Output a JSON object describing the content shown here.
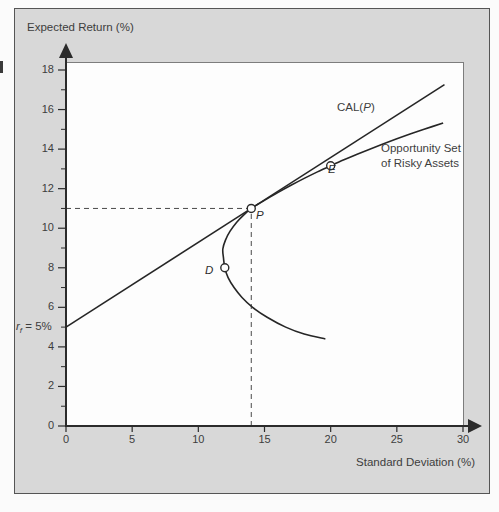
{
  "figure": {
    "y_axis_title": "Expected Return (%)",
    "x_axis_title": "Standard Deviation (%)",
    "rf_label": {
      "prefix": "r",
      "sub": "f",
      "suffix": " = 5%"
    },
    "cal_label": {
      "prefix": "CAL(",
      "p": "P",
      "suffix": ")"
    },
    "opportunity_label": {
      "line1": "Opportunity Set",
      "line2": "of Risky Assets"
    },
    "point_labels": {
      "p": "P",
      "d": "D",
      "e": "E"
    }
  },
  "colors": {
    "panel_background": "#d8d8d8",
    "line": "#262626",
    "dashed_guide": "#4a4a4a",
    "text": "#3d3d3d",
    "marker_fill": "#ffffff"
  },
  "chart_data": {
    "type": "line",
    "title": "",
    "xlabel": "Standard Deviation (%)",
    "ylabel": "Expected Return (%)",
    "xlim": [
      0,
      30
    ],
    "ylim": [
      0,
      18
    ],
    "x_ticks": [
      0,
      5,
      10,
      15,
      20,
      25,
      30
    ],
    "y_ticks": [
      0,
      2,
      4,
      6,
      8,
      10,
      12,
      14,
      16,
      18
    ],
    "grid": false,
    "risk_free_rate_pct": 5,
    "series": [
      {
        "name": "CAL(P)",
        "style": "straight",
        "points": [
          [
            0,
            5
          ],
          [
            28.6,
            17.26
          ]
        ]
      },
      {
        "name": "Opportunity Set of Risky Assets",
        "style": "smooth",
        "points": [
          [
            28.5,
            15.32
          ],
          [
            27,
            14.99
          ],
          [
            26,
            14.76
          ],
          [
            25,
            14.52
          ],
          [
            24,
            14.27
          ],
          [
            23,
            14.01
          ],
          [
            22,
            13.74
          ],
          [
            21,
            13.46
          ],
          [
            20,
            13.16
          ],
          [
            19,
            12.85
          ],
          [
            18,
            12.52
          ],
          [
            17,
            12.17
          ],
          [
            16,
            11.8
          ],
          [
            15,
            11.41
          ],
          [
            14.5,
            11.21
          ],
          [
            14,
            11
          ],
          [
            13.4,
            10.65
          ],
          [
            12.9,
            10.3
          ],
          [
            12.4,
            9.85
          ],
          [
            12.05,
            9.4
          ],
          [
            11.85,
            8.95
          ],
          [
            11.9,
            8.5
          ],
          [
            12,
            8
          ],
          [
            12.25,
            7.5
          ],
          [
            12.7,
            7
          ],
          [
            13.3,
            6.5
          ],
          [
            14.1,
            6
          ],
          [
            15.2,
            5.5
          ],
          [
            16.6,
            5
          ],
          [
            18,
            4.65
          ],
          [
            19.6,
            4.4
          ]
        ]
      }
    ],
    "marked_points": [
      {
        "label": "P",
        "x": 14,
        "y": 11,
        "description": "optimal risky portfolio, tangency point"
      },
      {
        "label": "D",
        "x": 12,
        "y": 8,
        "description": "debt fund"
      },
      {
        "label": "E",
        "x": 20,
        "y": 13.16,
        "description": "equity fund"
      }
    ],
    "dashed_guides": {
      "x": 14,
      "y": 11
    }
  }
}
